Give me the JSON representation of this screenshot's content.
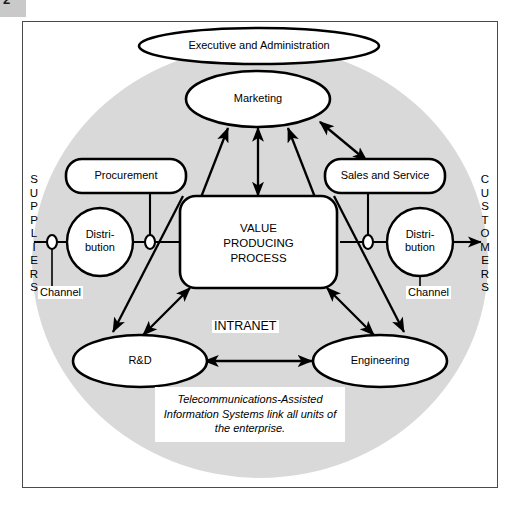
{
  "page": {
    "number": "2"
  },
  "diagram": {
    "title_node": "Executive and Administration",
    "intranet_label": "INTRANET",
    "left_axis_label": "S\nU\nP\nP\nL\nI\nE\nR\nS",
    "right_axis_label": "C\nU\nS\nT\nO\nM\nE\nR\nS",
    "left_axis_text": "SUPPLIERS",
    "right_axis_text": "CUSTOMERS",
    "caption": "Telecommunications-Assisted\nInformation Systems link all units of\nthe enterprise.",
    "nodes": {
      "executive": "Executive and Administration",
      "marketing": "Marketing",
      "procurement": "Procurement",
      "sales": "Sales and Service",
      "center": "VALUE\nPRODUCING\nPROCESS",
      "distribution_left": "Distri-\nbution",
      "distribution_right": "Distri-\nbution",
      "rnd": "R&D",
      "engineering": "Engineering"
    },
    "channel_labels": {
      "left": "Channel",
      "right": "Channel"
    },
    "colors": {
      "enterprise_circle": "#d9d9d9",
      "frame_border": "#4a4a4a",
      "node_stroke": "#000000",
      "node_fill": "#ffffff",
      "background": "#ffffff"
    }
  }
}
